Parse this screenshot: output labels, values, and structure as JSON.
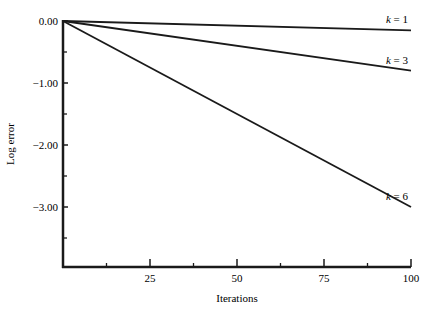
{
  "chart_data": {
    "type": "line",
    "title": "",
    "xlabel": "Iterations",
    "ylabel": "Log error",
    "xlim": [
      0,
      100
    ],
    "ylim": [
      -4.0,
      0.0
    ],
    "grid": false,
    "legend": "inline labels at line ends",
    "x_ticks": [
      25,
      50,
      75,
      100
    ],
    "x_tick_labels": [
      "25",
      "50",
      "75",
      "100"
    ],
    "x_minor_ticks": [
      12.5,
      37.5,
      62.5,
      87.5
    ],
    "y_ticks": [
      0,
      -1,
      -2,
      -3
    ],
    "y_tick_labels": [
      "0.00",
      "−1.00",
      "−2.00",
      "−3.00"
    ],
    "y_minor_ticks": [
      -0.5,
      -1.5,
      -2.5,
      -3.5
    ],
    "series": [
      {
        "name": "k = 1",
        "k": "1",
        "x": [
          0,
          100
        ],
        "values": [
          0.0,
          -0.15
        ]
      },
      {
        "name": "k = 3",
        "k": "3",
        "x": [
          0,
          100
        ],
        "values": [
          0.0,
          -0.8
        ]
      },
      {
        "name": "k = 6",
        "k": "6",
        "x": [
          0,
          100
        ],
        "values": [
          0.0,
          -3.0
        ]
      }
    ],
    "colors": {
      "line": "#1a1a1a",
      "axis": "#1a1a1a"
    }
  }
}
